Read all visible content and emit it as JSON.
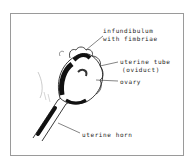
{
  "diagram": {
    "title": "",
    "labels": {
      "infundibulum_line1": "infundibulum",
      "infundibulum_line2": "with fimbriae",
      "uterine_tube_line1": "uterine tube",
      "uterine_tube_line2": "(oviduct)",
      "ovary": "ovary",
      "uterine_horn": "uterine horn"
    },
    "colors": {
      "ink": "#1a1a1a",
      "frame": "#9a9a9a",
      "background": "#ffffff"
    }
  }
}
